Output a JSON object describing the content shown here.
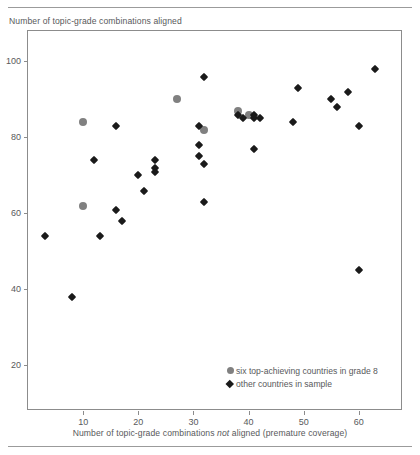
{
  "chart_data": {
    "type": "scatter",
    "title": "",
    "ylabel": "Number of topic-grade combinations aligned",
    "xlabel_parts": {
      "before": "Number of topic-grade combinations ",
      "italic": "not",
      "after": " aligned (premature coverage)"
    },
    "xlabel": "Number of topic-grade combinations not aligned (premature coverage)",
    "xlim": [
      0,
      68
    ],
    "ylim": [
      8,
      108
    ],
    "xticks": [
      10,
      20,
      30,
      40,
      50,
      60
    ],
    "yticks": [
      20,
      40,
      60,
      80,
      100
    ],
    "grid": false,
    "legend_position": "inside lower-right",
    "series": [
      {
        "name": "six top-achieving countries in grade 8",
        "marker": "circle",
        "color": "#808080",
        "points": [
          {
            "x": 10,
            "y": 84
          },
          {
            "x": 10,
            "y": 62
          },
          {
            "x": 27,
            "y": 90
          },
          {
            "x": 32,
            "y": 82
          },
          {
            "x": 38,
            "y": 87
          },
          {
            "x": 40,
            "y": 86
          }
        ]
      },
      {
        "name": "other countries in sample",
        "marker": "diamond",
        "color": "#1a1a1a",
        "points": [
          {
            "x": 3,
            "y": 54
          },
          {
            "x": 8,
            "y": 38
          },
          {
            "x": 12,
            "y": 74
          },
          {
            "x": 13,
            "y": 54
          },
          {
            "x": 16,
            "y": 83
          },
          {
            "x": 16,
            "y": 61
          },
          {
            "x": 17,
            "y": 58
          },
          {
            "x": 20,
            "y": 70
          },
          {
            "x": 21,
            "y": 66
          },
          {
            "x": 23,
            "y": 72
          },
          {
            "x": 23,
            "y": 74
          },
          {
            "x": 23,
            "y": 71
          },
          {
            "x": 31,
            "y": 83
          },
          {
            "x": 31,
            "y": 78
          },
          {
            "x": 31,
            "y": 75
          },
          {
            "x": 32,
            "y": 96
          },
          {
            "x": 32,
            "y": 73
          },
          {
            "x": 32,
            "y": 63
          },
          {
            "x": 38,
            "y": 86
          },
          {
            "x": 39,
            "y": 85
          },
          {
            "x": 41,
            "y": 86
          },
          {
            "x": 41,
            "y": 85
          },
          {
            "x": 42,
            "y": 85
          },
          {
            "x": 41,
            "y": 77
          },
          {
            "x": 48,
            "y": 84
          },
          {
            "x": 49,
            "y": 93
          },
          {
            "x": 55,
            "y": 90
          },
          {
            "x": 56,
            "y": 88
          },
          {
            "x": 58,
            "y": 92
          },
          {
            "x": 60,
            "y": 83
          },
          {
            "x": 60,
            "y": 45
          },
          {
            "x": 63,
            "y": 98
          }
        ]
      }
    ]
  },
  "legend": {
    "entries": [
      {
        "marker": "circle",
        "label": "six top-achieving countries in grade 8"
      },
      {
        "marker": "diamond",
        "label": "other countries in sample"
      }
    ]
  }
}
